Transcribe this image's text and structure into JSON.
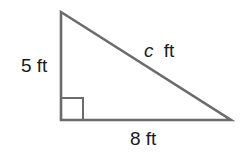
{
  "diagram": {
    "type": "right-triangle",
    "colors": {
      "stroke": "#6b6b6b",
      "text": "#1a1a1a",
      "background": "#ffffff"
    },
    "vertices": {
      "top": [
        61,
        12
      ],
      "right_angle": [
        61,
        120
      ],
      "right": [
        231,
        120
      ]
    },
    "right_angle_marker": {
      "x": 61,
      "y": 98,
      "size": 22
    },
    "labels": {
      "vertical_leg": {
        "value": "5",
        "unit": "ft",
        "text": "5 ft"
      },
      "horizontal_leg": {
        "value": "8",
        "unit": "ft",
        "text": "8 ft"
      },
      "hypotenuse": {
        "variable": "c",
        "unit": "ft",
        "text": "c ft"
      }
    }
  }
}
